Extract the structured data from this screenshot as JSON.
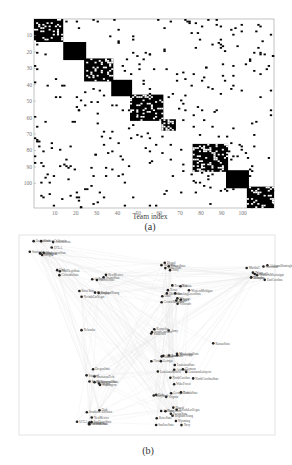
{
  "figure": {
    "panel_a": {
      "caption": "(a)",
      "xlabel": "Team index",
      "x_ticks": [
        "10",
        "20",
        "30",
        "40",
        "50",
        "60",
        "70",
        "80",
        "90",
        "100"
      ],
      "y_ticks": [
        "10",
        "20",
        "30",
        "40",
        "50",
        "60",
        "70",
        "80",
        "90",
        "100"
      ]
    },
    "panel_b": {
      "caption": "(b)"
    }
  },
  "chart_data": [
    {
      "type": "heatmap",
      "title": "",
      "xlabel": "Team index",
      "ylabel": "",
      "xlim": [
        0,
        115
      ],
      "ylim": [
        0,
        115
      ],
      "x_ticks": [
        10,
        20,
        30,
        40,
        50,
        60,
        70,
        80,
        90,
        100
      ],
      "y_ticks": [
        10,
        20,
        30,
        40,
        50,
        60,
        70,
        80,
        90,
        100
      ],
      "description": "Binary adjacency matrix of 115 teams, reordered to show block-diagonal community structure",
      "diagonal_blocks": [
        {
          "start": 1,
          "end": 14,
          "fill": "dense-speckled"
        },
        {
          "start": 15,
          "end": 25,
          "fill": "solid"
        },
        {
          "start": 25,
          "end": 38,
          "fill": "dense-speckled"
        },
        {
          "start": 38,
          "end": 47,
          "fill": "solid"
        },
        {
          "start": 47,
          "end": 62,
          "fill": "dense-speckled"
        },
        {
          "start": 62,
          "end": 68,
          "fill": "checkered"
        },
        {
          "start": 77,
          "end": 93,
          "fill": "dense-speckled"
        },
        {
          "start": 93,
          "end": 103,
          "fill": "solid"
        },
        {
          "start": 103,
          "end": 115,
          "fill": "dense-speckled"
        },
        {
          "start": 113,
          "end": 120,
          "fill": "ring"
        }
      ],
      "grid": false
    },
    {
      "type": "network",
      "description": "Force-directed layout of football team network, nodes labeled by team name",
      "visible_labels": [
        "OregonState",
        "Stanford",
        "Washington",
        "Oregon",
        "WashingtonState",
        "Arizona",
        "ArizonaState",
        "UCLA",
        "SouthernCalifornia",
        "SanDiegoState",
        "Utah",
        "ColoradoState",
        "NewMexico",
        "Wyoming",
        "BrighamYoung",
        "AirForce",
        "BoiseState",
        "NevadaLasVegas",
        "FresnoState",
        "SanJoseState",
        "Hawaii",
        "NotreDame",
        "Navy",
        "KansasState",
        "Nebraska",
        "Texas",
        "TexasTech",
        "Oklahoma",
        "Missouri",
        "Iowa",
        "Kansas",
        "Colorado",
        "BowlingGreenState",
        "CentralMichigan",
        "WesternMichigan",
        "Ohio",
        "Toledo",
        "Marshall",
        "Louisville",
        "Houston",
        "AlabamaBirmingham",
        "SouthernMississippi",
        "Memphis",
        "Tulane",
        "Cincinnati",
        "EastCarolina",
        "Army",
        "SouthCarolina",
        "Kentucky",
        "Vanderbilt",
        "Florida",
        "Georgia",
        "Tennessee",
        "Auburn",
        "Alabama",
        "MississippiState",
        "LouisianaState",
        "Mississippi",
        "Arkansas",
        "Clemson",
        "NorthCarolina",
        "NorthCarolinaState",
        "Virginia",
        "Duke",
        "WakeForest",
        "GeorgiaTech",
        "FloridaState",
        "Maryland",
        "LouisianaLafayette",
        "LouisianaMonroe",
        "LouisianaTech",
        "MiddleTennesseeState"
      ]
    }
  ]
}
